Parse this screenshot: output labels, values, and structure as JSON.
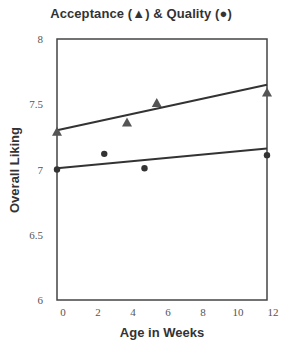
{
  "chart_data": {
    "type": "scatter",
    "title": "Acceptance (▲) & Quality (●)",
    "xlabel": "Age in Weeks",
    "ylabel": "Overall Liking",
    "xlim": [
      0,
      12
    ],
    "ylim": [
      6,
      8
    ],
    "xticks": [
      0,
      2,
      4,
      6,
      8,
      10,
      12
    ],
    "yticks": [
      6,
      6.5,
      7,
      7.5,
      8
    ],
    "ytick_labels": [
      "6",
      "6.5",
      "7",
      "7.5",
      "8"
    ],
    "grid": false,
    "legend": "in title",
    "series": [
      {
        "name": "Acceptance",
        "marker": "triangle",
        "points": [
          {
            "x": 0,
            "y": 7.29
          },
          {
            "x": 4,
            "y": 7.36
          },
          {
            "x": 5.7,
            "y": 7.51
          },
          {
            "x": 12,
            "y": 7.59
          }
        ],
        "fit_line": {
          "x0": 0,
          "y0": 7.3,
          "x1": 12,
          "y1": 7.65
        }
      },
      {
        "name": "Quality",
        "marker": "circle",
        "points": [
          {
            "x": 0,
            "y": 7.0
          },
          {
            "x": 2.7,
            "y": 7.12
          },
          {
            "x": 5.0,
            "y": 7.01
          },
          {
            "x": 12,
            "y": 7.11
          }
        ],
        "fit_line": {
          "x0": 0,
          "y0": 7.01,
          "x1": 12,
          "y1": 7.16
        }
      }
    ]
  },
  "labels": {
    "title": "Acceptance (▲)  & Quality (●)",
    "xlabel": "Age in Weeks",
    "ylabel": "Overall Liking"
  },
  "colors": {
    "axis": "#444444",
    "line": "#333333",
    "marker": "#555555"
  }
}
